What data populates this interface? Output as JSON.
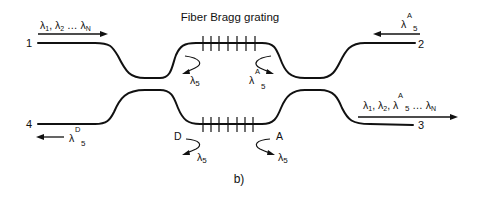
{
  "diagram": {
    "title": "Fiber Bragg grating",
    "caption": "b)",
    "ports": [
      {
        "id": "1",
        "label": "1",
        "signal": [
          "λ",
          "1",
          ", λ",
          "2",
          " … λ",
          "N"
        ],
        "direction": "in"
      },
      {
        "id": "2",
        "label": "2",
        "signal": [
          "λ",
          "A",
          "5"
        ],
        "direction": "in"
      },
      {
        "id": "3",
        "label": "3",
        "signal": [
          "λ",
          "1",
          ", λ",
          "2",
          ",  λ",
          "A",
          "5",
          " … λ",
          "N"
        ],
        "direction": "out"
      },
      {
        "id": "4",
        "label": "4",
        "signal": [
          "λ",
          "D",
          "5"
        ],
        "direction": "out"
      }
    ],
    "gratings": [
      {
        "id": "top",
        "ticks": 7,
        "reflections": [
          {
            "side": "left",
            "lambda": "λ",
            "sub": "5",
            "tag": ""
          },
          {
            "side": "right",
            "lambda": "λ",
            "sub": "5",
            "sup": "A"
          }
        ]
      },
      {
        "id": "bottom",
        "ticks": 7,
        "reflections": [
          {
            "side": "left",
            "lambda": "λ",
            "sub": "5",
            "tag": "D"
          },
          {
            "side": "right",
            "lambda": "λ",
            "sub": "5",
            "tag": "A"
          }
        ]
      }
    ],
    "stroke_color": "#111111",
    "background": "#ffffff"
  }
}
